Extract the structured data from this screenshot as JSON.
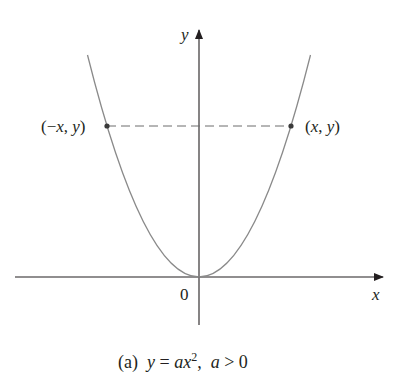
{
  "diagram": {
    "type": "parabola",
    "equation": "y = ax^2",
    "condition": "a > 0",
    "axes": {
      "x_label": "x",
      "y_label": "y",
      "origin_label": "0"
    },
    "points": [
      {
        "label_open": "(",
        "label_neg": "−",
        "label_x": "x",
        "label_comma": ", ",
        "label_y": "y",
        "label_close": ")",
        "name": "left-point"
      },
      {
        "label_open": "(",
        "label_x": "x",
        "label_comma": ", ",
        "label_y": "y",
        "label_close": ")",
        "name": "right-point"
      }
    ],
    "caption": {
      "tag": "(a)",
      "lhs": "y",
      "eq": " = ",
      "a": "a",
      "x": "x",
      "exp": "2",
      "sep": ",  ",
      "cond_a": "a",
      "cond_rel": " > 0"
    },
    "colors": {
      "axis": "#231f20",
      "curve": "#8a8a8a",
      "dash": "#6d6d6d",
      "point": "#3a3a3a"
    }
  }
}
